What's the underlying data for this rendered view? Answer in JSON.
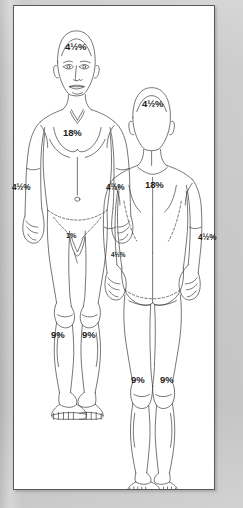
{
  "diagram": {
    "title": "Rule of Nines Burn Surface Area Chart",
    "frame_color": "#55585c",
    "panel_color": "#ffffff",
    "surround_color": "#c8c8c8",
    "line_color": "#3a3a3a",
    "label_color": "#1d1d1d"
  },
  "figures": [
    {
      "id": "anterior",
      "name": "Front view figure",
      "labels": [
        {
          "id": "front-head",
          "region": "Head (anterior)",
          "value": "4½%"
        },
        {
          "id": "front-torso",
          "region": "Anterior trunk",
          "value": "18%"
        },
        {
          "id": "front-arm-left",
          "region": "Left arm (anterior)",
          "value": "4½%"
        },
        {
          "id": "front-arm-right",
          "region": "Right arm (anterior)",
          "value": "4½%"
        },
        {
          "id": "front-hand-right",
          "region": "Right forearm / hand",
          "value": "4½%"
        },
        {
          "id": "front-groin",
          "region": "Perineum / genitalia",
          "value": "1%"
        },
        {
          "id": "front-leg-left",
          "region": "Left leg (anterior)",
          "value": "9%"
        },
        {
          "id": "front-leg-right",
          "region": "Right leg (anterior)",
          "value": "9%"
        }
      ]
    },
    {
      "id": "posterior",
      "name": "Back view figure",
      "labels": [
        {
          "id": "back-head",
          "region": "Head (posterior)",
          "value": "4½%"
        },
        {
          "id": "back-torso",
          "region": "Posterior trunk",
          "value": "18%"
        },
        {
          "id": "back-arm-right",
          "region": "Right arm (posterior)",
          "value": "4½%"
        },
        {
          "id": "back-leg-left",
          "region": "Left leg (posterior)",
          "value": "9%"
        },
        {
          "id": "back-leg-right",
          "region": "Right leg (posterior)",
          "value": "9%"
        }
      ]
    }
  ]
}
